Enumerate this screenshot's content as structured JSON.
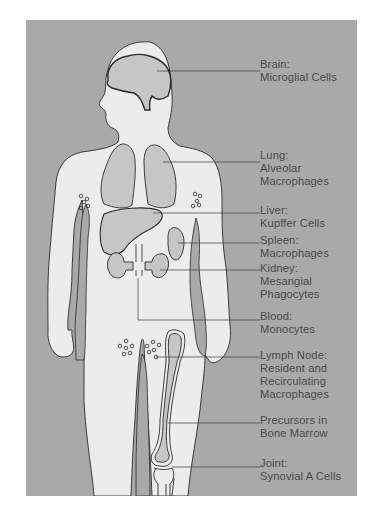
{
  "colors": {
    "background": "#a9a9a9",
    "body": "#ececec",
    "organ": "#c6c6c6",
    "outline": "#2a2a2a",
    "text": "#4a4a4a"
  },
  "labels": [
    {
      "id": "brain",
      "title": "Brain:",
      "lines": [
        "Microglial Cells"
      ]
    },
    {
      "id": "lung",
      "title": "Lung:",
      "lines": [
        "Alveolar",
        "Macrophages"
      ]
    },
    {
      "id": "liver",
      "title": "Liver:",
      "lines": [
        "Kupffer Cells"
      ]
    },
    {
      "id": "spleen",
      "title": "Spleen:",
      "lines": [
        "Macrophages"
      ]
    },
    {
      "id": "kidney",
      "title": "Kidney:",
      "lines": [
        "Mesangial",
        "Phagocytes"
      ]
    },
    {
      "id": "blood",
      "title": "Blood:",
      "lines": [
        "Monocytes"
      ]
    },
    {
      "id": "lymph-node",
      "title": "Lymph Node:",
      "lines": [
        "Resident and",
        "Recirculating",
        "Macrophages"
      ]
    },
    {
      "id": "bone-marrow",
      "title": "Precursors in",
      "lines": [
        "Bone Marrow"
      ]
    },
    {
      "id": "joint",
      "title": "Joint:",
      "lines": [
        "Synovial A Cells"
      ]
    }
  ]
}
